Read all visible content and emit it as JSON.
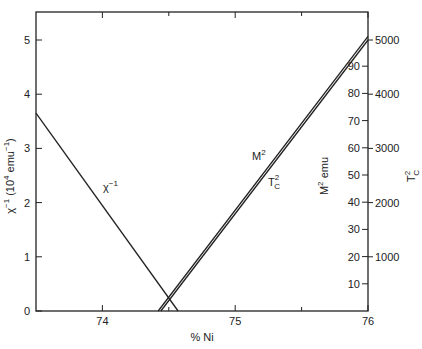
{
  "chart_data": {
    "type": "line",
    "title": "",
    "xlabel": "% Ni",
    "ylabel_left": "χ⁻¹ (10⁴ emu⁻¹)",
    "ylabel_right_inner": "M² emu",
    "ylabel_right_outer": "T_C²",
    "xlim": [
      73.5,
      76
    ],
    "ylim_left": [
      0,
      5.5
    ],
    "x_ticks": [
      {
        "value": 74,
        "label": "74"
      },
      {
        "value": 74.5,
        "label": ""
      },
      {
        "value": 75,
        "label": "75"
      },
      {
        "value": 75.5,
        "label": ""
      },
      {
        "value": 76,
        "label": "76"
      }
    ],
    "y_left_ticks": [
      {
        "value": 0,
        "label": "0"
      },
      {
        "value": 1,
        "label": "1"
      },
      {
        "value": 2,
        "label": "2"
      },
      {
        "value": 3,
        "label": "3"
      },
      {
        "value": 4,
        "label": "4"
      },
      {
        "value": 5,
        "label": "5"
      }
    ],
    "y_right_inner_ticks": [
      {
        "value": 10,
        "label": "10"
      },
      {
        "value": 20,
        "label": "20"
      },
      {
        "value": 30,
        "label": "30"
      },
      {
        "value": 40,
        "label": "40"
      },
      {
        "value": 50,
        "label": "50"
      },
      {
        "value": 60,
        "label": "60"
      },
      {
        "value": 70,
        "label": "70"
      },
      {
        "value": 80,
        "label": "80"
      },
      {
        "value": 90,
        "label": "90"
      }
    ],
    "y_right_outer_ticks": [
      {
        "value": 1000,
        "label": "1000"
      },
      {
        "value": 2000,
        "label": "2000"
      },
      {
        "value": 3000,
        "label": "3000"
      },
      {
        "value": 4000,
        "label": "4000"
      },
      {
        "value": 5000,
        "label": "5000"
      }
    ],
    "grid": false,
    "legend": "inline labels",
    "series": [
      {
        "name": "χ⁻¹",
        "axis": "left",
        "x": [
          73.5,
          74.57
        ],
        "y": [
          3.65,
          0
        ]
      },
      {
        "name": "M²",
        "axis": "right_inner",
        "x": [
          74.42,
          76
        ],
        "y": [
          0,
          101
        ]
      },
      {
        "name": "T_C²",
        "axis": "right_outer",
        "x": [
          74.44,
          76
        ],
        "y": [
          0,
          5000
        ]
      }
    ],
    "annotations": [
      {
        "text": "χ⁻¹",
        "near": "chi-inverse line"
      },
      {
        "text": "M²",
        "near": "M-squared line"
      },
      {
        "text": "T_C²",
        "near": "Tc-squared line"
      }
    ]
  },
  "labels": {
    "x_axis": "% Ni",
    "left_axis_main": "χ",
    "left_axis_sup": "−1",
    "left_axis_unit": "(10",
    "left_axis_unit_sup": "4",
    "left_axis_unit_rest": " emu",
    "left_axis_unit_sup2": "−1",
    "left_axis_close": ")",
    "right_inner_main": "M",
    "right_inner_sup": "2",
    "right_inner_rest": " emu",
    "right_outer_main": "T",
    "right_outer_sup": "2",
    "right_outer_sub": "C",
    "series_chi": "χ",
    "series_chi_sup": "−1",
    "series_m": "M",
    "series_m_sup": "2",
    "series_tc": "T",
    "series_tc_sup": "2",
    "series_tc_sub": "C"
  },
  "colors": {
    "line": "#222222",
    "axis": "#222222",
    "background": "#ffffff"
  }
}
